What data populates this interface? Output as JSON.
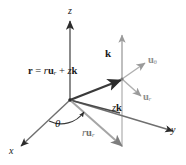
{
  "figure": {
    "colors": {
      "dark": "#2b2b2b",
      "gray": "#9a9a9a",
      "midgray": "#6e6e6e",
      "background": "#ffffff"
    }
  },
  "axes": [
    {
      "name": "z-axis",
      "label": "z",
      "direction": "up"
    },
    {
      "name": "x-axis",
      "label": "x",
      "direction": "down-left"
    },
    {
      "name": "y-axis",
      "label": "y",
      "direction": "right"
    }
  ],
  "labels": {
    "position_vector": {
      "bold_r": "r",
      "equals": "=",
      "scalar_r": "r",
      "u_base": "u",
      "u_sub": "r",
      "plus": "+",
      "z": "z",
      "k": "k"
    },
    "z_label": "z",
    "x_label": "x",
    "y_label": "y",
    "k_label": "k",
    "u_theta": {
      "base": "u",
      "sub": "θ"
    },
    "u_r": {
      "base": "u",
      "sub": "r"
    },
    "zk": {
      "z": "z",
      "k": "k"
    },
    "ru_r": {
      "r": "r",
      "base": "u",
      "sub": "r"
    },
    "theta": "θ"
  },
  "geometry": {
    "origin": {
      "x": 70,
      "y": 100
    },
    "point": {
      "x": 122,
      "y": 79
    },
    "z_axis_tip": {
      "x": 70,
      "y": 20
    },
    "x_axis_tip": {
      "x": 20,
      "y": 147
    },
    "y_axis_tip": {
      "x": 174,
      "y": 131
    },
    "vertical_guide_top": {
      "x": 122,
      "y": 35
    },
    "vertical_guide_bottom": {
      "x": 122,
      "y": 148
    },
    "u_theta_tip": {
      "x": 146,
      "y": 62
    },
    "u_r_tip": {
      "x": 142,
      "y": 97
    },
    "ru_r_tip": {
      "x": 122,
      "y": 148
    }
  }
}
